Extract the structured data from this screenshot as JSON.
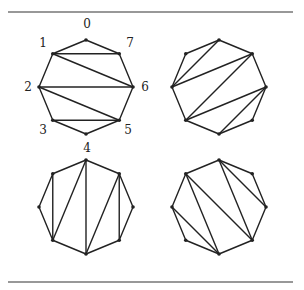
{
  "figure": {
    "rules": {
      "top_y": 12,
      "bottom_y": 282,
      "x1": 8,
      "x2": 293,
      "color": "#333333"
    },
    "stroke_color": "#222222",
    "vertex_labels": [
      "0",
      "1",
      "2",
      "3",
      "4",
      "5",
      "6",
      "7"
    ],
    "panels": [
      {
        "id": "top-left",
        "center": [
          86,
          87
        ],
        "labeled": true,
        "diagonals": [
          [
            1,
            7
          ],
          [
            1,
            6
          ],
          [
            2,
            6
          ],
          [
            2,
            5
          ],
          [
            3,
            5
          ]
        ]
      },
      {
        "id": "top-right",
        "center": [
          219,
          87
        ],
        "labeled": false,
        "diagonals": [
          [
            0,
            2
          ],
          [
            2,
            7
          ],
          [
            7,
            3
          ],
          [
            3,
            6
          ],
          [
            6,
            4
          ]
        ]
      },
      {
        "id": "bottom-left",
        "center": [
          86,
          207
        ],
        "labeled": false,
        "diagonals": [
          [
            1,
            3
          ],
          [
            3,
            0
          ],
          [
            0,
            4
          ],
          [
            4,
            7
          ],
          [
            7,
            5
          ]
        ]
      },
      {
        "id": "bottom-right",
        "center": [
          219,
          207
        ],
        "labeled": false,
        "diagonals": [
          [
            2,
            4
          ],
          [
            1,
            4
          ],
          [
            1,
            5
          ],
          [
            0,
            5
          ],
          [
            0,
            6
          ]
        ]
      }
    ],
    "label_positions_top_left": {
      "0": [
        87,
        28
      ],
      "1": [
        43,
        47
      ],
      "2": [
        28,
        91
      ],
      "3": [
        43,
        134
      ],
      "4": [
        87,
        152
      ],
      "5": [
        128,
        134
      ],
      "6": [
        145,
        91
      ],
      "7": [
        130,
        47
      ]
    }
  }
}
